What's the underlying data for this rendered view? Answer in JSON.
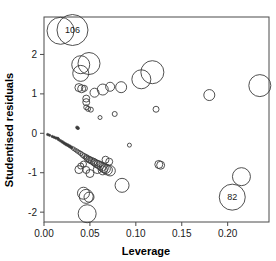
{
  "chart_data": {
    "type": "scatter",
    "title": "",
    "xlabel": "Leverage",
    "ylabel": "Studentised residuals",
    "xlim": [
      0.0,
      0.245
    ],
    "ylim": [
      -2.25,
      2.95
    ],
    "xticks": [
      0.0,
      0.05,
      0.1,
      0.15,
      0.2
    ],
    "xticklabels": [
      "0.00",
      "0.05",
      "0.10",
      "0.15",
      "0.20"
    ],
    "yticks": [
      -2,
      -1,
      0,
      1,
      2
    ],
    "yticklabels": [
      "-2",
      "-1",
      "0",
      "1",
      "2"
    ],
    "grid": false,
    "legend": null,
    "marker": "open-circle-variable-size",
    "size_meaning": "Cook's distance (bubble radius)",
    "annotations": [
      {
        "label": "106",
        "x": 0.031,
        "y": 2.62
      },
      {
        "label": "82",
        "x": 0.205,
        "y": -1.62
      }
    ],
    "points": [
      {
        "x": 0.018,
        "y": 2.6,
        "r": 13.5
      },
      {
        "x": 0.031,
        "y": 2.62,
        "r": 15.5
      },
      {
        "x": 0.04,
        "y": 1.74,
        "r": 9.0
      },
      {
        "x": 0.04,
        "y": 1.52,
        "r": 8.0
      },
      {
        "x": 0.049,
        "y": 1.77,
        "r": 11.0
      },
      {
        "x": 0.106,
        "y": 1.37,
        "r": 9.5
      },
      {
        "x": 0.118,
        "y": 1.55,
        "r": 11.5
      },
      {
        "x": 0.235,
        "y": 1.21,
        "r": 11.0
      },
      {
        "x": 0.18,
        "y": 0.97,
        "r": 5.5
      },
      {
        "x": 0.084,
        "y": 1.17,
        "r": 5.5
      },
      {
        "x": 0.072,
        "y": 1.18,
        "r": 4.5
      },
      {
        "x": 0.064,
        "y": 1.11,
        "r": 5.5
      },
      {
        "x": 0.055,
        "y": 1.03,
        "r": 4.5
      },
      {
        "x": 0.038,
        "y": 1.16,
        "r": 4.0
      },
      {
        "x": 0.041,
        "y": 1.13,
        "r": 4.0
      },
      {
        "x": 0.044,
        "y": 1.14,
        "r": 3.0
      },
      {
        "x": 0.046,
        "y": 0.88,
        "r": 3.5
      },
      {
        "x": 0.046,
        "y": 0.79,
        "r": 3.5
      },
      {
        "x": 0.046,
        "y": 0.66,
        "r": 2.5
      },
      {
        "x": 0.048,
        "y": 0.62,
        "r": 2.5
      },
      {
        "x": 0.051,
        "y": 0.6,
        "r": 2.5
      },
      {
        "x": 0.122,
        "y": 0.61,
        "r": 3.0
      },
      {
        "x": 0.077,
        "y": 0.49,
        "r": 2.5
      },
      {
        "x": 0.061,
        "y": 0.4,
        "r": 2.0
      },
      {
        "x": 0.037,
        "y": 0.13,
        "r": 1.5
      },
      {
        "x": 0.036,
        "y": 0.15,
        "r": 1.5
      },
      {
        "x": 0.004,
        "y": -0.03,
        "r": 1.2
      },
      {
        "x": 0.006,
        "y": -0.05,
        "r": 1.2
      },
      {
        "x": 0.009,
        "y": -0.08,
        "r": 1.2
      },
      {
        "x": 0.011,
        "y": -0.1,
        "r": 1.2
      },
      {
        "x": 0.013,
        "y": -0.12,
        "r": 1.3
      },
      {
        "x": 0.015,
        "y": -0.13,
        "r": 1.3
      },
      {
        "x": 0.016,
        "y": -0.16,
        "r": 1.3
      },
      {
        "x": 0.018,
        "y": -0.19,
        "r": 1.3
      },
      {
        "x": 0.02,
        "y": -0.22,
        "r": 1.4
      },
      {
        "x": 0.022,
        "y": -0.25,
        "r": 1.4
      },
      {
        "x": 0.024,
        "y": -0.28,
        "r": 1.5
      },
      {
        "x": 0.026,
        "y": -0.3,
        "r": 1.5
      },
      {
        "x": 0.028,
        "y": -0.33,
        "r": 1.6
      },
      {
        "x": 0.03,
        "y": -0.36,
        "r": 1.6
      },
      {
        "x": 0.032,
        "y": -0.39,
        "r": 1.8
      },
      {
        "x": 0.034,
        "y": -0.42,
        "r": 1.8
      },
      {
        "x": 0.036,
        "y": -0.45,
        "r": 2.0
      },
      {
        "x": 0.038,
        "y": -0.48,
        "r": 2.0
      },
      {
        "x": 0.04,
        "y": -0.51,
        "r": 2.2
      },
      {
        "x": 0.042,
        "y": -0.55,
        "r": 2.4
      },
      {
        "x": 0.044,
        "y": -0.58,
        "r": 2.6
      },
      {
        "x": 0.046,
        "y": -0.61,
        "r": 2.8
      },
      {
        "x": 0.047,
        "y": -0.64,
        "r": 3.0
      },
      {
        "x": 0.049,
        "y": -0.66,
        "r": 3.2
      },
      {
        "x": 0.05,
        "y": -0.68,
        "r": 3.2
      },
      {
        "x": 0.052,
        "y": -0.7,
        "r": 3.4
      },
      {
        "x": 0.054,
        "y": -0.72,
        "r": 3.4
      },
      {
        "x": 0.055,
        "y": -0.74,
        "r": 3.6
      },
      {
        "x": 0.057,
        "y": -0.77,
        "r": 3.8
      },
      {
        "x": 0.059,
        "y": -0.79,
        "r": 4.0
      },
      {
        "x": 0.061,
        "y": -0.82,
        "r": 4.2
      },
      {
        "x": 0.063,
        "y": -0.85,
        "r": 4.4
      },
      {
        "x": 0.065,
        "y": -0.88,
        "r": 4.6
      },
      {
        "x": 0.067,
        "y": -0.9,
        "r": 4.8
      },
      {
        "x": 0.069,
        "y": -0.93,
        "r": 5.0
      },
      {
        "x": 0.072,
        "y": -0.95,
        "r": 5.2
      },
      {
        "x": 0.043,
        "y": -0.78,
        "r": 3.0
      },
      {
        "x": 0.04,
        "y": -0.83,
        "r": 3.0
      },
      {
        "x": 0.038,
        "y": -0.92,
        "r": 4.0
      },
      {
        "x": 0.046,
        "y": -0.93,
        "r": 3.5
      },
      {
        "x": 0.05,
        "y": -1.02,
        "r": 4.0
      },
      {
        "x": 0.058,
        "y": -0.92,
        "r": 4.0
      },
      {
        "x": 0.064,
        "y": -0.94,
        "r": 4.5
      },
      {
        "x": 0.067,
        "y": -0.67,
        "r": 3.5
      },
      {
        "x": 0.071,
        "y": -0.72,
        "r": 3.5
      },
      {
        "x": 0.085,
        "y": -1.32,
        "r": 7.0
      },
      {
        "x": 0.093,
        "y": -0.3,
        "r": 2.0
      },
      {
        "x": 0.125,
        "y": -0.79,
        "r": 4.0
      },
      {
        "x": 0.127,
        "y": -0.81,
        "r": 4.0
      },
      {
        "x": 0.043,
        "y": -1.52,
        "r": 6.0
      },
      {
        "x": 0.046,
        "y": -1.6,
        "r": 7.0
      },
      {
        "x": 0.049,
        "y": -1.62,
        "r": 5.0
      },
      {
        "x": 0.047,
        "y": -2.04,
        "r": 9.0
      },
      {
        "x": 0.215,
        "y": -1.1,
        "r": 9.0
      },
      {
        "x": 0.205,
        "y": -1.62,
        "r": 13.0
      }
    ]
  },
  "axes": {
    "x_title": "Leverage",
    "y_title": "Studentised residuals"
  }
}
